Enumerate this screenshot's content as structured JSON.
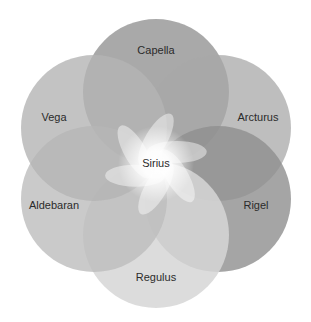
{
  "diagram": {
    "type": "venn-flower",
    "center": {
      "label": "Sirius",
      "x": 156,
      "y": 164
    },
    "circles": [
      {
        "label": "Capella",
        "cx": 156,
        "cy": 92,
        "r": 73,
        "fill": "#9a9a9a",
        "opacity": 0.85,
        "lx": 156,
        "ly": 51
      },
      {
        "label": "Arcturus",
        "cx": 218,
        "cy": 128,
        "r": 73,
        "fill": "#a8a8a8",
        "opacity": 0.75,
        "lx": 258,
        "ly": 118
      },
      {
        "label": "Rigel",
        "cx": 218,
        "cy": 199,
        "r": 73,
        "fill": "#8e8e8e",
        "opacity": 0.8,
        "lx": 256,
        "ly": 206
      },
      {
        "label": "Regulus",
        "cx": 156,
        "cy": 235,
        "r": 73,
        "fill": "#d6d6d6",
        "opacity": 0.85,
        "lx": 156,
        "ly": 278
      },
      {
        "label": "Aldebaran",
        "cx": 94,
        "cy": 199,
        "r": 73,
        "fill": "#bdbdbd",
        "opacity": 0.8,
        "lx": 54,
        "ly": 206
      },
      {
        "label": "Vega",
        "cx": 94,
        "cy": 128,
        "r": 73,
        "fill": "#b4b4b4",
        "opacity": 0.8,
        "lx": 54,
        "ly": 118
      }
    ],
    "glow_color": "#ffffff",
    "text_color": "#2b2b2b"
  }
}
